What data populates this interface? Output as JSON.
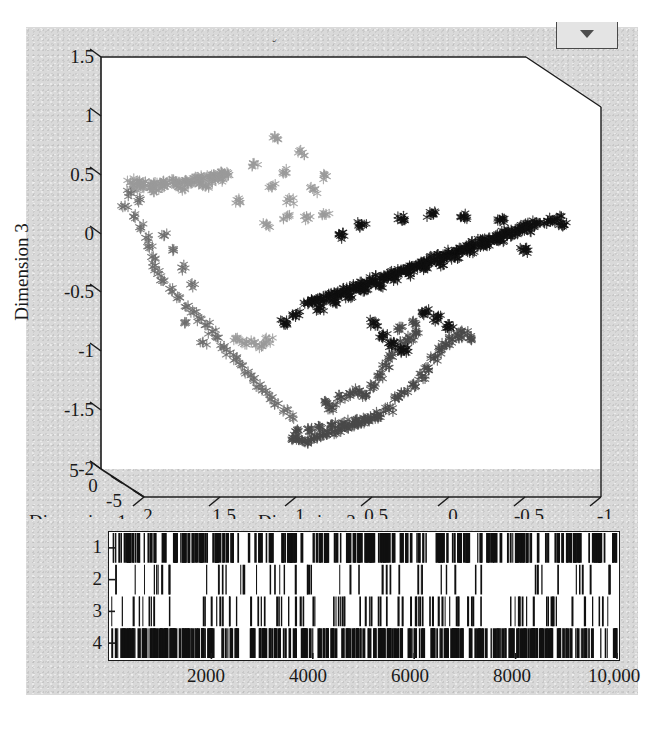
{
  "figure": {
    "title": "Fuzzy c-means classification",
    "background_color": "#d9d9d9",
    "plot_background_color": "#ffffff",
    "axis_color": "#1a1a1a"
  },
  "dropdown": {
    "icon": "chevron-down-icon",
    "label": ""
  },
  "chart_data": [
    {
      "type": "scatter",
      "title": "Fuzzy c-means classification",
      "projection": "3d",
      "xlabel": "Dimension 2",
      "ylabel": "Dimension 3",
      "zlabel": "Dimension 1",
      "xticks": [
        "2",
        "1.5",
        "1",
        "0.5",
        "0",
        "-0.5",
        "-1"
      ],
      "xlim": [
        2,
        -1
      ],
      "yticks": [
        "1.5",
        "1",
        "0.5",
        "0",
        "-0.5",
        "-1",
        "-1.5",
        "-2"
      ],
      "ylim": [
        -2,
        1.5
      ],
      "zticks": [
        "5",
        "0",
        "-5"
      ],
      "zlim": [
        5,
        -5
      ],
      "grid": false,
      "legend": "none",
      "marker": "star",
      "series": [
        {
          "name": "Cluster 1",
          "color": "#9a9a9a",
          "description": "light-gray elongated band, upper-left",
          "points": [
            [
              1.92,
              0.62
            ],
            [
              1.88,
              0.63
            ],
            [
              1.84,
              0.62
            ],
            [
              1.8,
              0.61
            ],
            [
              1.76,
              0.62
            ],
            [
              1.72,
              0.61
            ],
            [
              1.68,
              0.62
            ],
            [
              1.64,
              0.63
            ],
            [
              1.6,
              0.62
            ],
            [
              1.56,
              0.63
            ],
            [
              1.52,
              0.64
            ],
            [
              1.48,
              0.65
            ],
            [
              1.44,
              0.66
            ],
            [
              1.4,
              0.67
            ],
            [
              1.36,
              0.68
            ],
            [
              1.33,
              0.69
            ],
            [
              1.3,
              0.7
            ],
            [
              1.27,
              0.69
            ],
            [
              1.84,
              0.58
            ],
            [
              1.78,
              0.57
            ],
            [
              1.7,
              0.58
            ],
            [
              1.62,
              0.59
            ],
            [
              1.54,
              0.6
            ],
            [
              1.46,
              0.61
            ],
            [
              1.38,
              0.63
            ],
            [
              1.31,
              0.65
            ],
            [
              1.9,
              0.56
            ],
            [
              1.75,
              0.55
            ],
            [
              1.58,
              0.57
            ],
            [
              1.42,
              0.59
            ],
            [
              1.2,
              0.45
            ],
            [
              1.1,
              0.8
            ],
            [
              0.98,
              0.58
            ],
            [
              0.9,
              0.72
            ],
            [
              0.86,
              0.45
            ],
            [
              0.78,
              0.9
            ],
            [
              0.7,
              0.55
            ],
            [
              0.62,
              0.68
            ],
            [
              0.96,
              1.05
            ],
            [
              0.88,
              0.3
            ],
            [
              0.74,
              0.28
            ],
            [
              0.62,
              0.32
            ],
            [
              1.02,
              0.22
            ],
            [
              1.22,
              -0.85
            ],
            [
              1.16,
              -0.9
            ],
            [
              1.1,
              -0.88
            ],
            [
              1.05,
              -0.92
            ],
            [
              1.0,
              -0.86
            ]
          ]
        },
        {
          "name": "Cluster 2",
          "color": "#6e6e6e",
          "description": "mid-gray arc along left and lower-left",
          "points": [
            [
              1.96,
              0.4
            ],
            [
              1.9,
              0.3
            ],
            [
              1.86,
              0.2
            ],
            [
              1.82,
              0.1
            ],
            [
              1.8,
              0.02
            ],
            [
              1.78,
              -0.08
            ],
            [
              1.76,
              -0.16
            ],
            [
              1.74,
              -0.24
            ],
            [
              1.72,
              -0.3
            ],
            [
              1.66,
              -0.38
            ],
            [
              1.6,
              -0.46
            ],
            [
              1.54,
              -0.54
            ],
            [
              1.5,
              -0.6
            ],
            [
              1.46,
              -0.66
            ],
            [
              1.42,
              -0.72
            ],
            [
              1.38,
              -0.78
            ],
            [
              1.34,
              -0.84
            ],
            [
              1.3,
              -0.92
            ],
            [
              1.26,
              -0.98
            ],
            [
              1.22,
              -1.04
            ],
            [
              1.18,
              -1.1
            ],
            [
              1.14,
              -1.16
            ],
            [
              1.1,
              -1.22
            ],
            [
              1.06,
              -1.28
            ],
            [
              1.02,
              -1.34
            ],
            [
              0.98,
              -1.4
            ],
            [
              0.94,
              -1.46
            ],
            [
              0.9,
              -1.52
            ],
            [
              0.86,
              -1.58
            ],
            [
              1.7,
              0.12
            ],
            [
              1.64,
              -0.02
            ],
            [
              1.58,
              -0.18
            ],
            [
              1.52,
              -0.34
            ],
            [
              1.92,
              0.52
            ],
            [
              1.86,
              0.46
            ],
            [
              1.56,
              -0.7
            ],
            [
              1.44,
              -0.88
            ]
          ]
        },
        {
          "name": "Cluster 3",
          "color": "#4a4a4a",
          "description": "dark-gray band sweeping lower-center to right",
          "points": [
            [
              0.84,
              -1.78
            ],
            [
              0.8,
              -1.8
            ],
            [
              0.76,
              -1.82
            ],
            [
              0.72,
              -1.8
            ],
            [
              0.68,
              -1.78
            ],
            [
              0.64,
              -1.76
            ],
            [
              0.6,
              -1.74
            ],
            [
              0.56,
              -1.72
            ],
            [
              0.52,
              -1.7
            ],
            [
              0.48,
              -1.68
            ],
            [
              0.44,
              -1.66
            ],
            [
              0.4,
              -1.64
            ],
            [
              0.36,
              -1.62
            ],
            [
              0.32,
              -1.6
            ],
            [
              0.28,
              -1.58
            ],
            [
              0.82,
              -1.72
            ],
            [
              0.74,
              -1.7
            ],
            [
              0.66,
              -1.68
            ],
            [
              0.58,
              -1.66
            ],
            [
              0.5,
              -1.64
            ],
            [
              0.42,
              -1.62
            ],
            [
              0.34,
              -1.6
            ],
            [
              0.26,
              -1.56
            ],
            [
              0.2,
              -1.52
            ],
            [
              0.3,
              -1.3
            ],
            [
              0.26,
              -1.2
            ],
            [
              0.22,
              -1.1
            ],
            [
              0.18,
              -1.02
            ],
            [
              0.14,
              -0.96
            ],
            [
              0.1,
              -0.9
            ],
            [
              0.06,
              -0.84
            ],
            [
              0.02,
              -0.8
            ],
            [
              0.16,
              -1.42
            ],
            [
              0.1,
              -1.36
            ],
            [
              0.04,
              -1.28
            ],
            [
              -0.02,
              -1.2
            ],
            [
              -0.06,
              -1.12
            ],
            [
              -0.1,
              -1.04
            ],
            [
              -0.14,
              -0.96
            ],
            [
              -0.18,
              -0.9
            ],
            [
              -0.22,
              -0.86
            ],
            [
              -0.26,
              -0.82
            ],
            [
              -0.3,
              -0.8
            ],
            [
              -0.34,
              -0.84
            ],
            [
              0.52,
              -1.4
            ],
            [
              0.46,
              -1.36
            ],
            [
              0.4,
              -1.34
            ],
            [
              0.36,
              -1.38
            ],
            [
              0.62,
              -1.46
            ],
            [
              0.58,
              -1.5
            ],
            [
              0.12,
              -0.74
            ],
            [
              0.04,
              -0.7
            ]
          ]
        },
        {
          "name": "Cluster 4",
          "color": "#101010",
          "description": "black dense diagonal ridge, center to upper-right",
          "points": [
            [
              0.74,
              -0.52
            ],
            [
              0.7,
              -0.5
            ],
            [
              0.66,
              -0.48
            ],
            [
              0.62,
              -0.46
            ],
            [
              0.58,
              -0.44
            ],
            [
              0.54,
              -0.42
            ],
            [
              0.5,
              -0.4
            ],
            [
              0.46,
              -0.38
            ],
            [
              0.42,
              -0.36
            ],
            [
              0.38,
              -0.34
            ],
            [
              0.34,
              -0.32
            ],
            [
              0.3,
              -0.3
            ],
            [
              0.26,
              -0.28
            ],
            [
              0.22,
              -0.26
            ],
            [
              0.18,
              -0.24
            ],
            [
              0.14,
              -0.22
            ],
            [
              0.1,
              -0.2
            ],
            [
              0.06,
              -0.18
            ],
            [
              0.02,
              -0.16
            ],
            [
              -0.02,
              -0.14
            ],
            [
              -0.06,
              -0.12
            ],
            [
              -0.1,
              -0.1
            ],
            [
              -0.14,
              -0.08
            ],
            [
              -0.18,
              -0.06
            ],
            [
              -0.22,
              -0.04
            ],
            [
              -0.26,
              -0.02
            ],
            [
              -0.3,
              0.0
            ],
            [
              -0.34,
              0.02
            ],
            [
              -0.38,
              0.04
            ],
            [
              -0.42,
              0.06
            ],
            [
              -0.46,
              0.08
            ],
            [
              -0.5,
              0.1
            ],
            [
              -0.54,
              0.12
            ],
            [
              -0.58,
              0.14
            ],
            [
              -0.62,
              0.16
            ],
            [
              -0.66,
              0.18
            ],
            [
              -0.7,
              0.2
            ],
            [
              -0.74,
              0.22
            ],
            [
              -0.78,
              0.24
            ],
            [
              0.66,
              -0.56
            ],
            [
              0.56,
              -0.5
            ],
            [
              0.46,
              -0.44
            ],
            [
              0.36,
              -0.38
            ],
            [
              0.26,
              -0.34
            ],
            [
              0.16,
              -0.28
            ],
            [
              0.06,
              -0.24
            ],
            [
              -0.04,
              -0.18
            ],
            [
              -0.14,
              -0.14
            ],
            [
              -0.24,
              -0.08
            ],
            [
              -0.34,
              -0.02
            ],
            [
              -0.44,
              0.04
            ],
            [
              -0.54,
              0.08
            ],
            [
              -0.64,
              0.14
            ],
            [
              -0.72,
              0.18
            ],
            [
              0.82,
              -0.62
            ],
            [
              0.9,
              -0.7
            ],
            [
              0.52,
              0.12
            ],
            [
              0.38,
              0.22
            ],
            [
              0.12,
              0.28
            ],
            [
              -0.08,
              0.32
            ],
            [
              -0.3,
              0.3
            ],
            [
              -0.54,
              0.26
            ],
            [
              0.3,
              -0.7
            ],
            [
              0.24,
              -0.82
            ],
            [
              0.18,
              -0.9
            ],
            [
              0.1,
              -0.96
            ],
            [
              -0.04,
              -0.6
            ],
            [
              -0.12,
              -0.66
            ],
            [
              -0.2,
              -0.74
            ],
            [
              -0.7,
              -0.02
            ],
            [
              -0.86,
              0.26
            ],
            [
              -0.92,
              0.28
            ],
            [
              -0.96,
              0.22
            ]
          ]
        }
      ]
    },
    {
      "type": "raster",
      "description": "Cluster membership index vs sample number",
      "xlabel": "",
      "ylabel": "",
      "xticks": [
        "2000",
        "4000",
        "6000",
        "8000",
        "10,000"
      ],
      "xlim": [
        0,
        10000
      ],
      "yticks": [
        "1",
        "2",
        "3",
        "4"
      ],
      "ylim": [
        0.5,
        4.5
      ],
      "grid": false,
      "row_density": [
        0.46,
        0.1,
        0.18,
        0.62
      ],
      "n_samples": 10000,
      "line_color": "#101010"
    }
  ],
  "labels": {
    "dimension1": "Dimension 1",
    "dimension2": "Dimension 2",
    "dimension3": "Dimension 3"
  }
}
